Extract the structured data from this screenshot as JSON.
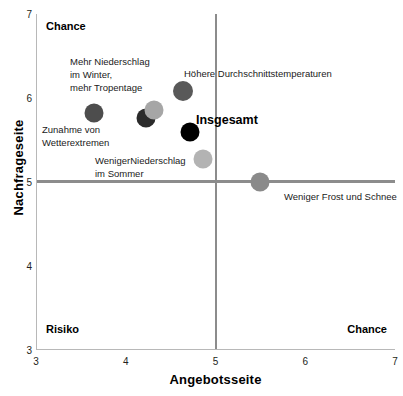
{
  "chart_data": {
    "type": "scatter",
    "title": "",
    "xlabel": "Angebotsseite",
    "ylabel": "Nachfrageseite",
    "xlim": [
      3,
      7
    ],
    "ylim": [
      3,
      7
    ],
    "xticks": [
      "3",
      "4",
      "5",
      "6",
      "7"
    ],
    "yticks": [
      "3",
      "4",
      "5",
      "6",
      "7"
    ],
    "grid": false,
    "legend": "none",
    "quadrant_lines": {
      "x": 5,
      "y": 5
    },
    "quadrant_labels": [
      {
        "text": "Chance",
        "corner": "top-left"
      },
      {
        "text": "Risiko",
        "corner": "bottom-left"
      },
      {
        "text": "Chance",
        "corner": "bottom-right"
      }
    ],
    "points": [
      {
        "label": "Zunahme von\nWetterextremen",
        "x": 3.65,
        "y": 5.82,
        "color": "#4d4d4d",
        "size": 19
      },
      {
        "label": "",
        "x": 4.23,
        "y": 5.76,
        "color": "#2b2b2b",
        "size": 19
      },
      {
        "label": "Mehr Niederschlag\nim Winter,\nmehr Tropentage",
        "x": 4.32,
        "y": 5.86,
        "color": "#a6a6a6",
        "size": 19
      },
      {
        "label": "Höhere Durchschnittstemperaturen",
        "x": 4.64,
        "y": 6.08,
        "color": "#595959",
        "size": 20
      },
      {
        "label": "Insgesamt",
        "x": 4.72,
        "y": 5.6,
        "color": "#000000",
        "size": 19
      },
      {
        "label": "WenigerNiederschlag\nim Sommer",
        "x": 4.86,
        "y": 5.27,
        "color": "#b3b3b3",
        "size": 19
      },
      {
        "label": "Weniger Frost und Schnee",
        "x": 5.5,
        "y": 5.0,
        "color": "#8a8a8a",
        "size": 19
      }
    ],
    "annotations": [
      {
        "text": "Mehr Niederschlag",
        "x_px": 70,
        "y_px": 56
      },
      {
        "text": "im Winter,",
        "x_px": 70,
        "y_px": 69
      },
      {
        "text": "mehr Tropentage",
        "x_px": 70,
        "y_px": 82
      },
      {
        "text": "Höhere Durchschnittstemperaturen",
        "x_px": 184,
        "y_px": 68
      },
      {
        "text": "Zunahme von",
        "x_px": 42,
        "y_px": 124
      },
      {
        "text": "Wetterextremen",
        "x_px": 42,
        "y_px": 137
      },
      {
        "text": "Insgesamt",
        "x_px": 196,
        "y_px": 113
      },
      {
        "text": "WenigerNiederschlag",
        "x_px": 95,
        "y_px": 155
      },
      {
        "text": "im Sommer",
        "x_px": 95,
        "y_px": 168
      },
      {
        "text": "Weniger Frost und Schnee",
        "x_px": 284,
        "y_px": 191
      }
    ]
  },
  "axes": {
    "x_title": "Angebotsseite",
    "y_title": "Nachfrageseite"
  },
  "quadrants": {
    "top_left": "Chance",
    "bottom_left": "Risiko",
    "bottom_right": "Chance"
  }
}
